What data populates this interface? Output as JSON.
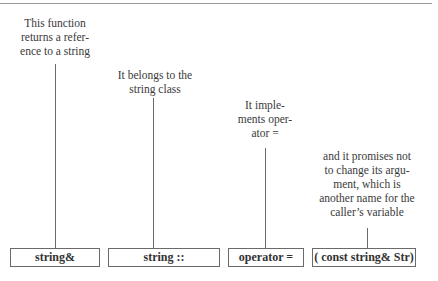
{
  "diagram": {
    "annotations": [
      {
        "id": "a1",
        "text": "This function returns a reference to a string",
        "lines": [
          "This function",
          "returns a refer-",
          "ence to a string"
        ],
        "points_to": "string&"
      },
      {
        "id": "a2",
        "text": "It belongs to the string class",
        "lines": [
          "It belongs to the",
          "string class"
        ],
        "points_to": "string ::"
      },
      {
        "id": "a3",
        "text": "It implements operator =",
        "lines": [
          "It imple-",
          "ments oper-",
          "ator ="
        ],
        "points_to": "operator ="
      },
      {
        "id": "a4",
        "text": "and it promises not to change its argument, which is another name for the caller's variable",
        "lines": [
          "and it promises not",
          "to change its argu-",
          "ment, which is",
          "another name for the",
          "caller’s variable"
        ],
        "points_to": "( const string& Str)"
      }
    ],
    "boxes": [
      {
        "label": "string&"
      },
      {
        "label": "string ::"
      },
      {
        "label": "operator ="
      },
      {
        "label": "( const string& Str)"
      }
    ],
    "colors": {
      "line": "#6a6a6a",
      "text": "#3a3a3a",
      "rule": "#9a9a9a"
    }
  }
}
